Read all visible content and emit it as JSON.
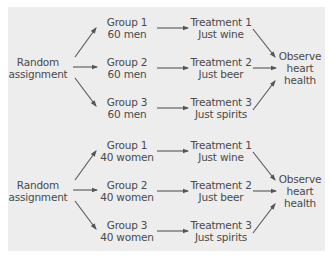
{
  "diagram": {
    "blocks": [
      {
        "source": {
          "line1": "Random",
          "line2": "assignment"
        },
        "groups": [
          {
            "name": "Group 1",
            "size": "60 men"
          },
          {
            "name": "Group 2",
            "size": "60 men"
          },
          {
            "name": "Group 3",
            "size": "60 men"
          }
        ],
        "treatments": [
          {
            "name": "Treatment 1",
            "desc": "Just wine"
          },
          {
            "name": "Treatment 2",
            "desc": "Just beer"
          },
          {
            "name": "Treatment 3",
            "desc": "Just spirits"
          }
        ],
        "outcome": {
          "line1": "Observe",
          "line2": "heart",
          "line3": "health"
        }
      },
      {
        "source": {
          "line1": "Random",
          "line2": "assignment"
        },
        "groups": [
          {
            "name": "Group 1",
            "size": "40 women"
          },
          {
            "name": "Group 2",
            "size": "40 women"
          },
          {
            "name": "Group 3",
            "size": "40 women"
          }
        ],
        "treatments": [
          {
            "name": "Treatment 1",
            "desc": "Just wine"
          },
          {
            "name": "Treatment 2",
            "desc": "Just beer"
          },
          {
            "name": "Treatment 3",
            "desc": "Just spirits"
          }
        ],
        "outcome": {
          "line1": "Observe",
          "line2": "heart",
          "line3": "health"
        }
      }
    ],
    "colors": {
      "panel": "#ededed",
      "text": "#4a4a4a",
      "arrow": "#555555"
    }
  }
}
